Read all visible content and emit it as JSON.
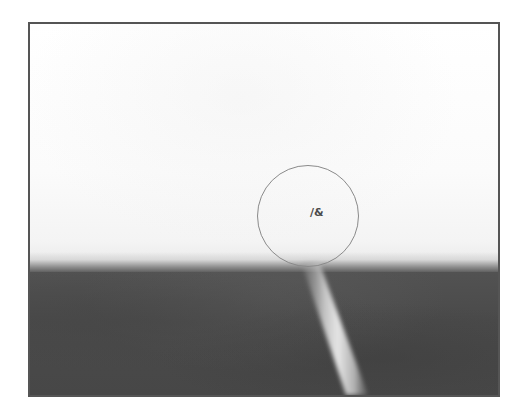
{
  "image": {
    "frame": {
      "border_color": "#555555"
    },
    "scene": {
      "sky_color": "#fdfdfd",
      "ground_color": "#4a4a4a",
      "stick_color": "#d8d8d8"
    },
    "overlay": {
      "circle_color": "#8a8a8a",
      "label": "/&"
    }
  }
}
